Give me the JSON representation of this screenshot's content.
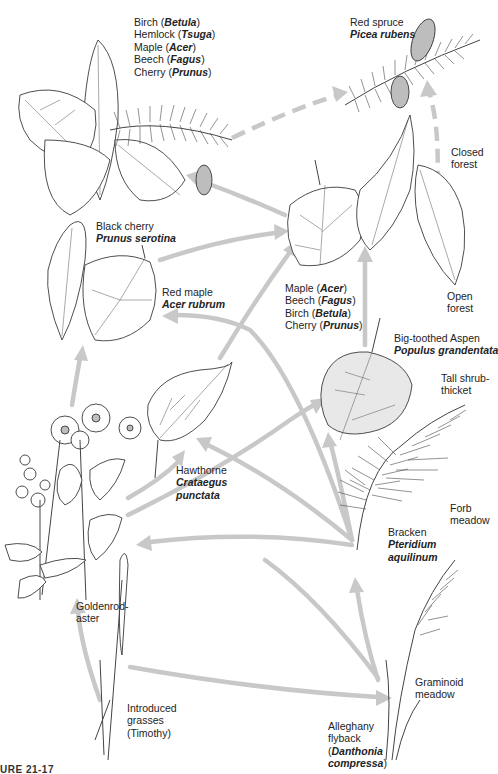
{
  "figure": {
    "type": "successional-pathway-diagram",
    "caption_fragment": "URE 21-17",
    "arrow_color": "#c8c8c8",
    "line_color": "#3a3a3a"
  },
  "stages": {
    "closed_forest_conifer": {
      "common": "Red spruce",
      "scientific": "Picea rubens"
    },
    "mixed_hardwood_hemlock": {
      "lines": [
        {
          "common": "Birch",
          "genus": "Betula"
        },
        {
          "common": "Hemlock",
          "genus": "Tsuga"
        },
        {
          "common": "Maple",
          "genus": "Acer"
        },
        {
          "common": "Beech",
          "genus": "Fagus"
        },
        {
          "common": "Cherry",
          "genus": "Prunus"
        }
      ]
    },
    "closed_forest_label": {
      "line1": "Closed",
      "line2": "forest"
    },
    "open_forest_label": {
      "line1": "Open",
      "line2": "forest"
    },
    "northern_hardwoods": {
      "lines": [
        {
          "common": "Maple",
          "genus": "Acer"
        },
        {
          "common": "Beech",
          "genus": "Fagus"
        },
        {
          "common": "Birch",
          "genus": "Betula"
        },
        {
          "common": "Cherry",
          "genus": "Prunus"
        }
      ]
    },
    "black_cherry": {
      "common": "Black cherry",
      "scientific": "Prunus serotina"
    },
    "red_maple": {
      "common": "Red maple",
      "scientific": "Acer rubrum"
    },
    "aspen": {
      "common": "Big-toothed Aspen",
      "scientific": "Populus grandentata"
    },
    "tall_shrub_label": {
      "line1": "Tall shrub-",
      "line2": "thicket"
    },
    "hawthorne": {
      "common": "Hawthorne",
      "scientific_line1": "Crataegus",
      "scientific_line2": "punctata"
    },
    "forb_meadow_label": {
      "line1": "Forb",
      "line2": "meadow"
    },
    "bracken": {
      "common": "Bracken",
      "scientific_line1": "Pteridium",
      "scientific_line2": "aquilinum"
    },
    "goldenrod": {
      "line1": "Goldenrod-",
      "line2": "aster"
    },
    "graminoid_label": {
      "line1": "Graminoid",
      "line2": "meadow"
    },
    "introduced_grasses": {
      "line1": "Introduced",
      "line2": "grasses",
      "line3": "(Timothy)"
    },
    "oatgrass": {
      "line1": "Alleghany",
      "line2": "flyback",
      "line3_open": "(",
      "scientific_line3": "Danthonia",
      "scientific_line4": "compressa",
      "line4_close": ")"
    }
  }
}
